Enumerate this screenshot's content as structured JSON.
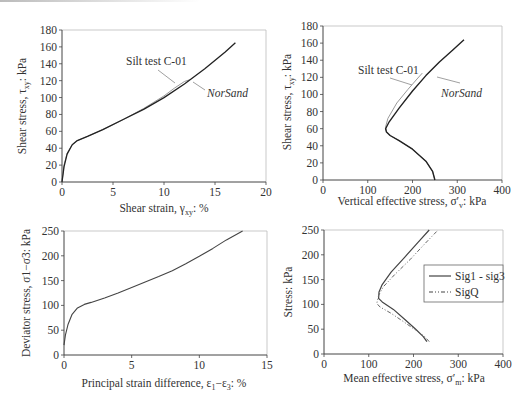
{
  "chart_data": [
    {
      "type": "line",
      "title": "",
      "xlabel": "Shear strain, γxy: %",
      "ylabel": "Shear stress, τxy: kPa",
      "xlim": [
        0,
        20
      ],
      "ylim": [
        0,
        180
      ],
      "xticks": [
        0,
        5,
        10,
        15,
        20
      ],
      "yticks": [
        0,
        20,
        40,
        60,
        80,
        100,
        120,
        140,
        160,
        180
      ],
      "grid": false,
      "annotations": [
        "Silt test C-01",
        "NorSand"
      ],
      "series": [
        {
          "name": "Silt test C-01",
          "x": [
            0,
            0.2,
            0.5,
            1.0,
            1.5,
            2.5,
            4,
            6,
            8,
            10,
            11,
            12,
            12.5
          ],
          "y": [
            0,
            20,
            34,
            44,
            49,
            54,
            62,
            74,
            87,
            102,
            111,
            119,
            121
          ]
        },
        {
          "name": "NorSand",
          "x": [
            0,
            0.2,
            0.5,
            1.0,
            1.5,
            2.5,
            4,
            6,
            8,
            10,
            12,
            14,
            16,
            17
          ],
          "y": [
            0,
            18,
            33,
            44,
            49,
            54,
            62,
            74,
            86,
            100,
            116,
            134,
            154,
            165
          ]
        }
      ]
    },
    {
      "type": "line",
      "title": "",
      "xlabel": "Vertical effective stress, σ'v: kPa",
      "ylabel": "Shear stress, τxy: kPa",
      "xlim": [
        0,
        400
      ],
      "ylim": [
        0,
        180
      ],
      "xticks": [
        0,
        100,
        200,
        300,
        400
      ],
      "yticks": [
        0,
        20,
        40,
        60,
        80,
        100,
        120,
        140,
        160,
        180
      ],
      "grid": false,
      "annotations": [
        "Silt test C-01",
        "NorSand"
      ],
      "series": [
        {
          "name": "Silt test C-01",
          "x": [
            250,
            245,
            230,
            200,
            170,
            150,
            142,
            140,
            145,
            165,
            190,
            210,
            222
          ],
          "y": [
            0,
            10,
            22,
            36,
            46,
            52,
            56,
            62,
            72,
            90,
            106,
            118,
            125
          ]
        },
        {
          "name": "NorSand",
          "x": [
            250,
            245,
            230,
            200,
            170,
            150,
            142,
            140,
            148,
            170,
            200,
            230,
            260,
            290,
            315
          ],
          "y": [
            0,
            10,
            22,
            36,
            46,
            52,
            56,
            60,
            68,
            84,
            104,
            122,
            138,
            152,
            164
          ]
        }
      ]
    },
    {
      "type": "line",
      "title": "",
      "xlabel": "Principal strain difference, ε1−ε3: %",
      "ylabel": "Deviator stress, σ1−σ3: kPa",
      "xlim": [
        0,
        15
      ],
      "ylim": [
        0,
        250
      ],
      "xticks": [
        0,
        5,
        10,
        15
      ],
      "yticks": [
        0,
        50,
        100,
        150,
        200,
        250
      ],
      "grid": false,
      "series": [
        {
          "name": "Deviator stress",
          "x": [
            0,
            0.1,
            0.3,
            0.6,
            1.0,
            1.5,
            2,
            3,
            4,
            5,
            6,
            7,
            8,
            9,
            10,
            11,
            12,
            13.2
          ],
          "y": [
            20,
            40,
            62,
            82,
            95,
            102,
            106,
            115,
            125,
            136,
            147,
            158,
            170,
            184,
            199,
            215,
            232,
            250
          ]
        }
      ]
    },
    {
      "type": "line",
      "title": "",
      "xlabel": "Mean effective stress, σ'm: kPa",
      "ylabel": "Stress: kPa",
      "xlim": [
        0,
        400
      ],
      "ylim": [
        0,
        250
      ],
      "xticks": [
        0,
        100,
        200,
        300,
        400
      ],
      "yticks": [
        0,
        50,
        100,
        150,
        200,
        250
      ],
      "grid": false,
      "legend": {
        "position": "right",
        "entries": [
          "Sig1 - sig3",
          "SigQ"
        ]
      },
      "series": [
        {
          "name": "Sig1 - sig3",
          "x": [
            230,
            222,
            205,
            180,
            155,
            130,
            122,
            123,
            130,
            150,
            180,
            210,
            235
          ],
          "y": [
            25,
            35,
            50,
            70,
            90,
            105,
            112,
            125,
            140,
            165,
            195,
            225,
            250
          ]
        },
        {
          "name": "SigQ",
          "x": [
            235,
            225,
            205,
            178,
            150,
            125,
            118,
            122,
            132,
            158,
            192,
            225,
            255
          ],
          "y": [
            25,
            35,
            48,
            65,
            82,
            95,
            102,
            118,
            135,
            160,
            190,
            222,
            250
          ]
        }
      ]
    }
  ],
  "panels": {
    "tl": {
      "ylabel_main": "Shear stress, τ",
      "ylabel_sub": "xy",
      "ylabel_tail": ": kPa",
      "xlabel_main": "Shear strain, γ",
      "xlabel_sub": "xy",
      "xlabel_tail": ": %",
      "ann1": "Silt test C-01",
      "ann2": "NorSand"
    },
    "tr": {
      "ylabel_main": "Shear stress, τ",
      "ylabel_sub": "xy",
      "ylabel_tail": ": kPa",
      "xlabel_main": "Vertical effective stress, σ′",
      "xlabel_sub": "v",
      "xlabel_tail": ": kPa",
      "ann1": "Silt test C-01",
      "ann2": "NorSand"
    },
    "bl": {
      "ylabel": "Deviator stress, σ1−σ3: kPa",
      "xlabel_main": "Principal strain difference, ε",
      "xlabel_sub1": "1",
      "xlabel_mid": "−ε",
      "xlabel_sub2": "3",
      "xlabel_tail": ": %"
    },
    "br": {
      "ylabel": "Stress: kPa",
      "xlabel_main": "Mean effective stress, σ′",
      "xlabel_sub": "m",
      "xlabel_tail": ": kPa",
      "legend1": "Sig1 - sig3",
      "legend2": "SigQ"
    }
  }
}
